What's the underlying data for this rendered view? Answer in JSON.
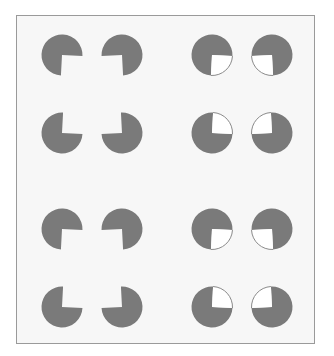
{
  "figure": {
    "title": "",
    "colors": {
      "inducer_fill": "#7a7a7a",
      "wedge_fill": "#ffffff",
      "wedge_outline": "#8a8a8a",
      "background": "#f7f7f7",
      "frame_border": "#9a9a9a"
    },
    "radius": 20.5,
    "panels": [
      {
        "name": "top-left-kanizsa",
        "wedge_filled": false,
        "inducers": [
          {
            "cx": 62,
            "cy": 55,
            "start": 3,
            "end": 93
          },
          {
            "cx": 122,
            "cy": 55,
            "start": 87,
            "end": 177
          },
          {
            "cx": 62,
            "cy": 133,
            "start": -87,
            "end": 3
          },
          {
            "cx": 122,
            "cy": 133,
            "start": 177,
            "end": 267
          }
        ]
      },
      {
        "name": "top-right-control",
        "wedge_filled": true,
        "inducers": [
          {
            "cx": 212,
            "cy": 55,
            "start": 3,
            "end": 93
          },
          {
            "cx": 272,
            "cy": 55,
            "start": 87,
            "end": 177
          },
          {
            "cx": 212,
            "cy": 133,
            "start": -87,
            "end": 3
          },
          {
            "cx": 272,
            "cy": 133,
            "start": 177,
            "end": 267
          }
        ]
      },
      {
        "name": "bottom-left-kanizsa",
        "wedge_filled": false,
        "inducers": [
          {
            "cx": 62,
            "cy": 229,
            "start": 3,
            "end": 93
          },
          {
            "cx": 122,
            "cy": 229,
            "start": 87,
            "end": 177
          },
          {
            "cx": 62,
            "cy": 307,
            "start": -87,
            "end": 3
          },
          {
            "cx": 122,
            "cy": 307,
            "start": 177,
            "end": 267
          }
        ]
      },
      {
        "name": "bottom-right-control",
        "wedge_filled": true,
        "inducers": [
          {
            "cx": 212,
            "cy": 229,
            "start": 3,
            "end": 93
          },
          {
            "cx": 272,
            "cy": 229,
            "start": 87,
            "end": 177
          },
          {
            "cx": 212,
            "cy": 307,
            "start": -87,
            "end": 3
          },
          {
            "cx": 272,
            "cy": 307,
            "start": 177,
            "end": 267
          }
        ]
      }
    ]
  }
}
